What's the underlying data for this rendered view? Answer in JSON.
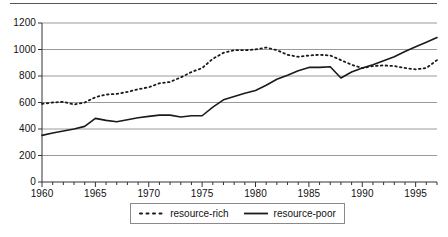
{
  "chart_data": {
    "type": "line",
    "title": "",
    "subtitle": "",
    "xlabel": "",
    "ylabel": "",
    "xlim": [
      1960,
      1997
    ],
    "ylim": [
      0,
      1200
    ],
    "grid": "horizontal",
    "legend_position": "bottom-center",
    "yticks": [
      0,
      200,
      400,
      600,
      800,
      1000,
      1200
    ],
    "ytick_labels": [
      "0",
      "200",
      "400",
      "600",
      "800",
      "1000",
      "1200"
    ],
    "xticks": [
      1960,
      1965,
      1970,
      1975,
      1980,
      1985,
      1990,
      1995
    ],
    "xtick_labels": [
      "1960",
      "1965",
      "1970",
      "1975",
      "1980",
      "1985",
      "1990",
      "1995"
    ],
    "x": [
      1960,
      1961,
      1962,
      1963,
      1964,
      1965,
      1966,
      1967,
      1968,
      1969,
      1970,
      1971,
      1972,
      1973,
      1974,
      1975,
      1976,
      1977,
      1978,
      1979,
      1980,
      1981,
      1982,
      1983,
      1984,
      1985,
      1986,
      1987,
      1988,
      1989,
      1990,
      1991,
      1992,
      1993,
      1994,
      1995,
      1996,
      1997
    ],
    "series": [
      {
        "name": "resource-rich",
        "style": "dotted",
        "color": "#1a1a1a",
        "values": [
          590,
          600,
          605,
          585,
          600,
          640,
          660,
          665,
          680,
          700,
          715,
          745,
          755,
          790,
          830,
          860,
          930,
          975,
          995,
          995,
          1000,
          1015,
          995,
          960,
          945,
          955,
          960,
          955,
          920,
          885,
          860,
          875,
          880,
          875,
          860,
          850,
          860,
          920
        ]
      },
      {
        "name": "resource-poor",
        "style": "solid",
        "color": "#1a1a1a",
        "values": [
          352,
          370,
          385,
          400,
          420,
          480,
          465,
          455,
          470,
          485,
          495,
          505,
          505,
          490,
          500,
          500,
          565,
          620,
          645,
          670,
          690,
          730,
          775,
          805,
          840,
          865,
          865,
          870,
          785,
          830,
          860,
          885,
          915,
          945,
          985,
          1020,
          1055,
          1090
        ]
      }
    ]
  },
  "legend": {
    "items": [
      {
        "label": "resource-rich",
        "style": "dotted"
      },
      {
        "label": "resource-poor",
        "style": "solid"
      }
    ]
  },
  "axes": {
    "y_labels": [
      "1200",
      "1000",
      "800",
      "600",
      "400",
      "200",
      "0"
    ],
    "x_labels": [
      "1960",
      "1965",
      "1970",
      "1975",
      "1980",
      "1985",
      "1990",
      "1995"
    ]
  },
  "colors": {
    "line": "#1a1a1a",
    "grid": "#9a9a9a",
    "axis": "#333333",
    "rule": "#555555",
    "legend_border": "#8a8a8a",
    "background": "#ffffff"
  }
}
